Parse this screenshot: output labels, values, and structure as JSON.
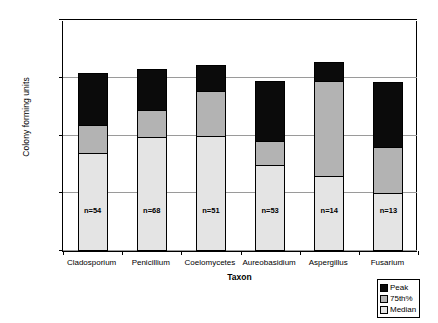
{
  "chart_data": {
    "type": "bar",
    "title": "",
    "xlabel": "Taxon",
    "ylabel": "Colony forming units",
    "yscale": "log",
    "ylim": [
      100,
      1000000
    ],
    "ytick_labels": [
      "1000000",
      "100000",
      "10000",
      "1000",
      "100"
    ],
    "ytick_values": [
      1000000,
      100000,
      10000,
      1000,
      100
    ],
    "grid": true,
    "legend_position": "bottom-right",
    "categories": [
      "Cladosporium",
      "Penicillium",
      "Coelomycetes",
      "Aureobasidium",
      "Aspergillus",
      "Fusarium"
    ],
    "annotations": [
      "n=54",
      "n=68",
      "n=51",
      "n=53",
      "n=14",
      "n=13"
    ],
    "series": [
      {
        "name": "Peak",
        "color": "#0b0b0b",
        "values": [
          120000,
          140000,
          165000,
          88000,
          190000,
          85000
        ]
      },
      {
        "name": "75th%",
        "color": "#b3b3b3",
        "values": [
          15000,
          28000,
          60000,
          8000,
          88000,
          6300
        ]
      },
      {
        "name": "Median",
        "color": "#e4e4e4",
        "values": [
          5000,
          9500,
          10000,
          3100,
          2000,
          1000
        ]
      }
    ]
  },
  "legend": {
    "items": [
      {
        "label": "Peak",
        "color": "#0b0b0b"
      },
      {
        "label": "75th%",
        "color": "#b3b3b3"
      },
      {
        "label": "Median",
        "color": "#e4e4e4"
      }
    ]
  }
}
